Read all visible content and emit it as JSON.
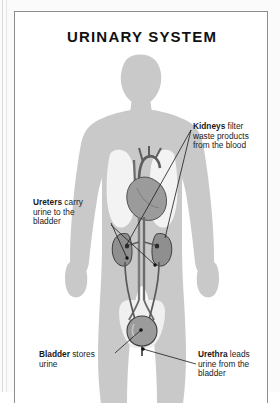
{
  "figure": {
    "title": "URINARY SYSTEM",
    "border_color": "#8d8d8d",
    "background_color": "#ffffff"
  },
  "colors": {
    "body_silhouette": "#c9c9c9",
    "lung_field": "#f2f2f2",
    "organ_fill": "#9a9a9a",
    "organ_outline": "#4a4a4a",
    "leader_line": "#1a1a1a",
    "text": "#1a1a1a"
  },
  "callouts": [
    {
      "id": "kidneys",
      "term": "Kidneys",
      "rest": " filter\nwaste products\nfrom the blood",
      "target": "kidneys"
    },
    {
      "id": "ureters",
      "term": "Ureters",
      "rest": " carry\nurine to the\nbladder",
      "target": "ureters"
    },
    {
      "id": "bladder",
      "term": "Bladder",
      "rest": " stores\nurine",
      "target": "bladder"
    },
    {
      "id": "urethra",
      "term": "Urethra",
      "rest": " leads\nurine from the\nbladder",
      "target": "urethra"
    }
  ],
  "anatomy": {
    "body_parts": [
      "head",
      "neck",
      "shoulders",
      "torso",
      "arms",
      "hands",
      "legs"
    ],
    "organs": [
      "heart",
      "aorta",
      "lungs",
      "left-kidney",
      "right-kidney",
      "left-ureter",
      "right-ureter",
      "bladder",
      "urethra"
    ]
  }
}
